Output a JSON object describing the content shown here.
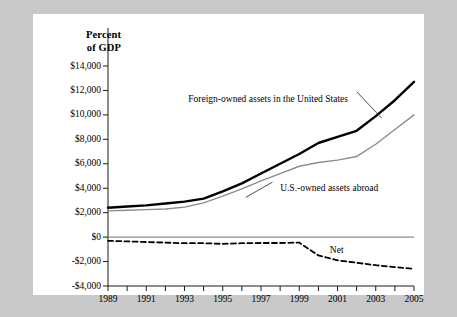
{
  "chart_data": {
    "type": "line",
    "title": "",
    "subtitle": "",
    "ylabel_line1": "Percent",
    "ylabel_line2": "of GDP",
    "xlabel": "",
    "x": [
      1989,
      1990,
      1991,
      1992,
      1993,
      1994,
      1995,
      1996,
      1997,
      1998,
      1999,
      2000,
      2001,
      2002,
      2003,
      2004,
      2005
    ],
    "xlim": [
      1989,
      2005
    ],
    "ylim": [
      -4000,
      14000
    ],
    "yticks": [
      14000,
      12000,
      10000,
      8000,
      6000,
      4000,
      2000,
      0,
      -2000,
      -4000
    ],
    "ytick_labels": [
      "$14,000",
      "$12,000",
      "$10,000",
      "$8,000",
      "$6,000",
      "$4,000",
      "$2,000",
      "$0",
      "-$2,000",
      "-$4,000"
    ],
    "xticks": [
      1989,
      1990,
      1991,
      1992,
      1993,
      1994,
      1995,
      1996,
      1997,
      1998,
      1999,
      2000,
      2001,
      2002,
      2003,
      2004,
      2005
    ],
    "xtick_labels_shown": [
      "1989",
      "1991",
      "1993",
      "1995",
      "1997",
      "1999",
      "2001",
      "2003",
      "2005"
    ],
    "grid": false,
    "legend_position": "inline-annotations",
    "series": [
      {
        "name": "Foreign-owned assets in the United States",
        "style": "solid-thick-black",
        "color": "#000000",
        "values": [
          2400,
          2500,
          2600,
          2750,
          2900,
          3150,
          3750,
          4400,
          5200,
          6000,
          6800,
          7700,
          8200,
          8700,
          9900,
          11200,
          12700
        ]
      },
      {
        "name": "U.S.-owned assets abroad",
        "style": "solid-thin-gray",
        "color": "#8c8c8c",
        "values": [
          2150,
          2200,
          2250,
          2300,
          2450,
          2800,
          3350,
          3950,
          4600,
          5200,
          5800,
          6100,
          6300,
          6600,
          7600,
          8800,
          10000
        ]
      },
      {
        "name": "Net",
        "style": "dashed-black",
        "color": "#000000",
        "values": [
          -300,
          -350,
          -400,
          -450,
          -500,
          -500,
          -550,
          -500,
          -480,
          -480,
          -450,
          -1500,
          -1900,
          -2100,
          -2300,
          -2450,
          -2600
        ]
      }
    ],
    "annotations": [
      {
        "text": "Foreign-owned assets in the United States",
        "x": 1993.2,
        "y": 11200
      },
      {
        "text": "U.S.-owned assets abroad",
        "x": 1998.0,
        "y": 3900
      },
      {
        "text": "Net",
        "x": 2000.6,
        "y": -1150
      }
    ]
  }
}
